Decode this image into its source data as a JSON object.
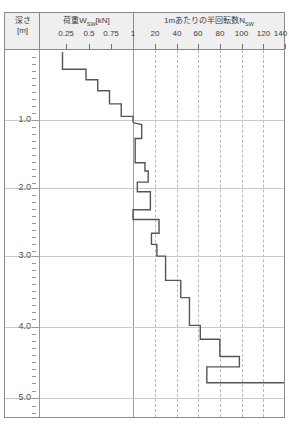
{
  "chart_data": {
    "type": "line",
    "ylabel": "深さ [m]",
    "ylim": [
      0,
      5.2
    ],
    "grid": true,
    "legend": false,
    "axes": [
      {
        "name": "load",
        "label": "荷重Wsw [kN]",
        "label_main": "荷重W",
        "label_sub": "SW",
        "label_unit": "[kN]",
        "ticks": [
          0.25,
          0.5,
          0.75,
          1
        ],
        "tick_labels": [
          "0.25",
          "0.5",
          "0.75",
          "1"
        ],
        "xlim": [
          0,
          1
        ]
      },
      {
        "name": "nsw",
        "label": "1mあたりの半回転数Nsw",
        "label_main": "1mあたりの半回転数N",
        "label_sub": "SW",
        "ticks": [
          20,
          40,
          60,
          80,
          100,
          120,
          140
        ],
        "tick_labels": [
          "20",
          "40",
          "60",
          "80",
          "100",
          "120",
          "140"
        ],
        "xlim": [
          0,
          140
        ]
      }
    ],
    "depth_ticks": [
      1.0,
      2.0,
      3.0,
      4.0,
      5.0
    ],
    "depth_tick_labels": [
      "1.0",
      "2.0",
      "3.0",
      "4.0",
      "5.0"
    ],
    "series": [
      {
        "name": "荷重Wsw",
        "axis": "load",
        "step": true,
        "points": [
          {
            "depth": 0.0,
            "value": 0.25
          },
          {
            "depth": 0.25,
            "value": 0.25
          },
          {
            "depth": 0.25,
            "value": 0.5
          },
          {
            "depth": 0.4,
            "value": 0.5
          },
          {
            "depth": 0.4,
            "value": 0.625
          },
          {
            "depth": 0.56,
            "value": 0.625
          },
          {
            "depth": 0.56,
            "value": 0.75
          },
          {
            "depth": 0.75,
            "value": 0.75
          },
          {
            "depth": 0.75,
            "value": 0.875
          },
          {
            "depth": 0.93,
            "value": 0.875
          },
          {
            "depth": 0.93,
            "value": 1.0
          },
          {
            "depth": 1.02,
            "value": 1.0
          }
        ]
      },
      {
        "name": "半回転数Nsw",
        "axis": "nsw",
        "step": true,
        "points": [
          {
            "depth": 1.02,
            "value": 0
          },
          {
            "depth": 1.05,
            "value": 8
          },
          {
            "depth": 1.25,
            "value": 8
          },
          {
            "depth": 1.25,
            "value": 2
          },
          {
            "depth": 1.6,
            "value": 2
          },
          {
            "depth": 1.6,
            "value": 11
          },
          {
            "depth": 1.72,
            "value": 11
          },
          {
            "depth": 1.72,
            "value": 14
          },
          {
            "depth": 1.88,
            "value": 14
          },
          {
            "depth": 1.88,
            "value": 4
          },
          {
            "depth": 2.02,
            "value": 4
          },
          {
            "depth": 2.02,
            "value": 16
          },
          {
            "depth": 2.28,
            "value": 16
          },
          {
            "depth": 2.28,
            "value": 0
          },
          {
            "depth": 2.42,
            "value": 0
          },
          {
            "depth": 2.42,
            "value": 24
          },
          {
            "depth": 2.62,
            "value": 24
          },
          {
            "depth": 2.62,
            "value": 17
          },
          {
            "depth": 2.78,
            "value": 17
          },
          {
            "depth": 2.78,
            "value": 22
          },
          {
            "depth": 2.95,
            "value": 22
          },
          {
            "depth": 2.95,
            "value": 30
          },
          {
            "depth": 3.3,
            "value": 30
          },
          {
            "depth": 3.3,
            "value": 44
          },
          {
            "depth": 3.55,
            "value": 44
          },
          {
            "depth": 3.55,
            "value": 52
          },
          {
            "depth": 3.95,
            "value": 52
          },
          {
            "depth": 3.95,
            "value": 62
          },
          {
            "depth": 4.15,
            "value": 62
          },
          {
            "depth": 4.15,
            "value": 80
          },
          {
            "depth": 4.4,
            "value": 80
          },
          {
            "depth": 4.4,
            "value": 98
          },
          {
            "depth": 4.55,
            "value": 98
          },
          {
            "depth": 4.55,
            "value": 68
          },
          {
            "depth": 4.78,
            "value": 68
          },
          {
            "depth": 4.78,
            "value": 140
          },
          {
            "depth": 5.06,
            "value": 140
          }
        ]
      }
    ],
    "colors": {
      "curve": "#555555",
      "grid_solid": "#c9c9c9",
      "grid_dashed": "#b9b9b9",
      "axis": "#8a8a8a",
      "header_bg": "#efefef",
      "text": "#3b3b3b"
    }
  },
  "header": {
    "depth_title_line1": "深さ",
    "depth_title_line2": "[m]",
    "load_title": "荷重W",
    "load_title_sub": "SW",
    "load_title_unit": "[kN]",
    "nsw_title": "1mあたりの半回転数N",
    "nsw_title_sub": "SW",
    "load_tick_labels": [
      "0.25",
      "0.5",
      "0.75",
      "1"
    ],
    "nsw_tick_labels": [
      "20",
      "40",
      "60",
      "80",
      "100",
      "120",
      "140"
    ]
  }
}
